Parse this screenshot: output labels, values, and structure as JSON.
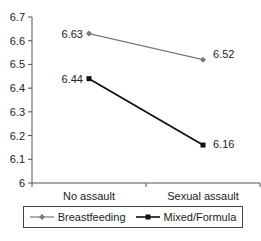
{
  "chart_data": {
    "type": "line",
    "title": "",
    "xlabel": "",
    "ylabel": "",
    "categories": [
      "No assault",
      "Sexual assault"
    ],
    "series": [
      {
        "name": "Breastfeeding",
        "values": [
          6.63,
          6.52
        ],
        "color": "#7a7a7a",
        "marker": "diamond"
      },
      {
        "name": "Mixed/Formula",
        "values": [
          6.44,
          6.16
        ],
        "color": "#111111",
        "marker": "square"
      }
    ],
    "ylim": [
      6,
      6.7
    ],
    "yticks": [
      "6",
      "6.1",
      "6.2",
      "6.3",
      "6.4",
      "6.5",
      "6.6",
      "6.7"
    ],
    "data_labels": {
      "Breastfeeding": [
        "6.63",
        "6.52"
      ],
      "Mixed/Formula": [
        "6.44",
        "6.16"
      ]
    },
    "grid": false,
    "legend_position": "bottom"
  },
  "legend": {
    "items": [
      {
        "label": "Breastfeeding"
      },
      {
        "label": "Mixed/Formula"
      }
    ]
  }
}
